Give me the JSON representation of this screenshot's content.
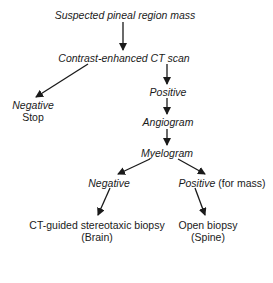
{
  "diagram": {
    "type": "flowchart",
    "nodes": {
      "start": {
        "text": "Suspected pineal region mass",
        "style": "italic"
      },
      "ct_scan": {
        "text": "Contrast-enhanced CT scan",
        "style": "italic"
      },
      "ct_negative": {
        "line1": "Negative",
        "line2": "Stop"
      },
      "ct_positive": {
        "text": "Positive",
        "style": "italic"
      },
      "angiogram": {
        "text": "Angiogram",
        "style": "italic"
      },
      "myelogram": {
        "text": "Myelogram",
        "style": "italic"
      },
      "myelo_negative": {
        "text": "Negative",
        "style": "italic"
      },
      "myelo_positive": {
        "italic_part": "Positive",
        "plain_part": " (for mass)"
      },
      "brain_biopsy": {
        "line1": "CT-guided stereotaxic biopsy",
        "line2": "(Brain)"
      },
      "spine_biopsy": {
        "line1": "Open biopsy",
        "line2": "(Spine)"
      }
    },
    "edges": [
      {
        "from": "start",
        "to": "ct_scan"
      },
      {
        "from": "ct_scan",
        "to": "ct_negative"
      },
      {
        "from": "ct_scan",
        "to": "ct_positive"
      },
      {
        "from": "ct_positive",
        "to": "angiogram"
      },
      {
        "from": "angiogram",
        "to": "myelogram"
      },
      {
        "from": "myelogram",
        "to": "myelo_negative"
      },
      {
        "from": "myelogram",
        "to": "myelo_positive"
      },
      {
        "from": "myelo_negative",
        "to": "brain_biopsy"
      },
      {
        "from": "myelo_positive",
        "to": "spine_biopsy"
      }
    ],
    "colors": {
      "ink": "#1a1a1a",
      "background": "#ffffff"
    }
  }
}
